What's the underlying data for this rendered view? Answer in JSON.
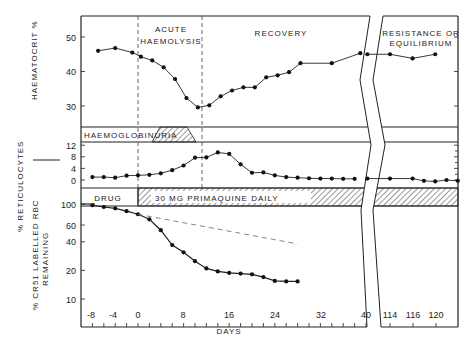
{
  "chart_data": {
    "type": "line",
    "title": "",
    "xlabel": "DAYS",
    "x_ticks": [
      "-8",
      "-4",
      "0",
      "8",
      "16",
      "24",
      "32",
      "40",
      "114",
      "116",
      "120"
    ],
    "phases": [
      "ACUTE HAEMOLYSIS",
      "RECOVERY",
      "RESISTANCE OR EQUILIBRIUM"
    ],
    "bands": {
      "haemoglobinuria": "HAEMOGLOBINURIA",
      "drug": "DRUG",
      "primaquine": "30 MG PRIMAQUINE DAILY"
    },
    "panels": [
      {
        "name": "haematocrit",
        "ylabel": "HAEMATOCRIT %",
        "y_ticks": [
          "50",
          "40",
          "30"
        ],
        "ylim": [
          25,
          56
        ],
        "series": [
          {
            "name": "Haematocrit",
            "x": [
              -7,
              -4,
              -1,
              0.5,
              2.5,
              4.5,
              6.5,
              8.5,
              10.5,
              12.5,
              14.5,
              16.5,
              18.5,
              20.5,
              22.5,
              24.5,
              26.5,
              28.5,
              34,
              39
            ],
            "values": [
              46,
              46.8,
              45.5,
              44.3,
              43.2,
              41.2,
              37.8,
              32.3,
              29.6,
              30.2,
              32.8,
              34.5,
              35.4,
              35.4,
              38.3,
              38.9,
              39.8,
              42.4,
              42.4,
              45.3
            ]
          },
          {
            "name": "Haematocrit (late)",
            "x": [
              112,
              114,
              116,
              118
            ],
            "values": [
              45,
              45,
              43.8,
              45
            ]
          }
        ]
      },
      {
        "name": "reticulocytes",
        "ylabel": "% RETICULOCYTES",
        "y_ticks": [
          "12",
          "8",
          "4",
          "0"
        ],
        "ylim": [
          -1,
          13
        ],
        "series": [
          {
            "name": "Reticulocytes",
            "x": [
              -8,
              -6,
              -4,
              -2,
              0,
              2,
              4,
              6,
              8,
              10,
              12,
              14,
              16,
              18,
              20,
              22,
              24,
              26,
              28,
              30,
              32,
              34,
              36,
              38
            ],
            "values": [
              1,
              1,
              0.8,
              1.5,
              1.6,
              1.8,
              2.3,
              3.4,
              5,
              7.7,
              7.8,
              9.5,
              9,
              5.4,
              2.5,
              2.6,
              1.6,
              1,
              0.8,
              0.6,
              0.5,
              0.5,
              0.4,
              0.4
            ]
          },
          {
            "name": "Reticulocytes (late)",
            "x": [
              112,
              114,
              116,
              117,
              118,
              119,
              120
            ],
            "values": [
              0.5,
              0.5,
              0.5,
              -0.3,
              -0.5,
              0,
              -0.3
            ]
          }
        ]
      },
      {
        "name": "cr51",
        "ylabel": "% CR51 LABELLED RBC REMAINING",
        "y_ticks": [
          "100",
          "60",
          "40",
          "20",
          "10"
        ],
        "scale": "log",
        "ylim": [
          10,
          100
        ],
        "series": [
          {
            "name": "Cr51 labelled RBC",
            "x": [
              -8,
              -6,
              -4,
              -2,
              0,
              2,
              4,
              6,
              8,
              10,
              12,
              14,
              16,
              18,
              20,
              22,
              24,
              26,
              28
            ],
            "values": [
              97,
              93,
              90,
              84,
              78,
              69,
              53,
              37,
              31,
              25,
              21,
              19.5,
              18.8,
              18.5,
              18.2,
              17,
              15.5,
              15.3,
              15.3
            ]
          },
          {
            "name": "Expected survival (dashed)",
            "x": [
              0,
              28
            ],
            "values": [
              78,
              38
            ]
          }
        ]
      }
    ]
  }
}
